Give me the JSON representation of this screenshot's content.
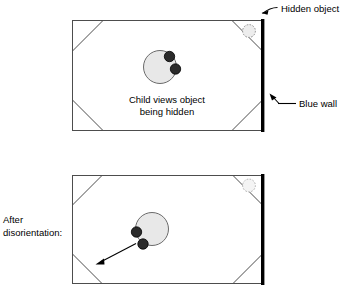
{
  "figure": {
    "title_visible": false,
    "background_color": "#ffffff",
    "line_color": "#4d4d4d",
    "wall_color": "#000000",
    "person_body_color": "#e8e8e8",
    "person_head_color": "#2b2b2b",
    "object_fill_color": "#ededed"
  },
  "annotations": {
    "hidden_object_label": "Hidden object",
    "blue_wall_label": "Blue wall",
    "after_disorientation_label_line1": "After",
    "after_disorientation_label_line2": "disorientation:"
  },
  "panels": [
    {
      "id": "top-panel",
      "caption_line1": "Child views object",
      "caption_line2": "being hidden",
      "person_orientation": "facing-right",
      "hidden_object_corner": "top-right",
      "search_arrow": false
    },
    {
      "id": "bottom-panel",
      "caption_line1": "",
      "caption_line2": "",
      "person_orientation": "facing-left",
      "hidden_object_corner": "top-right",
      "search_arrow": true,
      "search_arrow_target_corner": "bottom-left"
    }
  ]
}
